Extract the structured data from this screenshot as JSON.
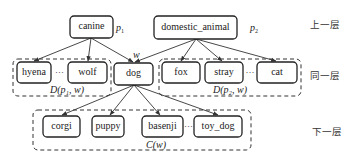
{
  "nodes": {
    "canine": "canine",
    "domestic_animal": "domestic_animal",
    "hyena": "hyena",
    "wolf": "wolf",
    "dog": "dog",
    "fox": "fox",
    "stray": "stray",
    "cat": "cat",
    "corgi": "corgi",
    "puppy": "puppy",
    "basenji": "basenji",
    "toy_dog": "toy_dog"
  },
  "labels": {
    "p1": "p",
    "p1_sub": "1",
    "p2": "p",
    "p2_sub": "2",
    "w": "w",
    "group_left": "D(p₁, w)",
    "group_right": "D(p₂, w)",
    "group_bottom": "C(w)",
    "ellipsis": "···"
  },
  "layers": {
    "upper": "上一层",
    "same": "同一层",
    "lower": "下一层"
  }
}
